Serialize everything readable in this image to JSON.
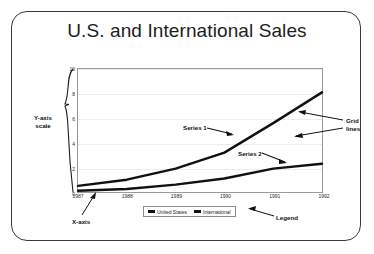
{
  "slide": {
    "title": "U.S. and International Sales",
    "background_color": "#ffffff",
    "border_color": "#3a3a3a"
  },
  "annotations": {
    "series1": "Series 1",
    "series2": "Series 2",
    "gridlines_line1": "Grid",
    "gridlines_line2": "lines",
    "yaxis_line1": "Y-axis",
    "yaxis_line2": "scale",
    "xaxis": "X-axis",
    "legend": "Legend"
  },
  "legend": {
    "items": [
      {
        "label": "United States",
        "color": "#111111"
      },
      {
        "label": "International",
        "color": "#111111"
      }
    ]
  },
  "chart_data": {
    "type": "line",
    "title": "U.S. and International Sales",
    "xlabel": "",
    "ylabel": "",
    "x": [
      "1987",
      "1988",
      "1989",
      "1990",
      "1991",
      "1992"
    ],
    "categories": [
      "1987",
      "1988",
      "1989",
      "1990",
      "1991",
      "1992"
    ],
    "yticks": [
      0,
      2,
      4,
      6,
      8,
      10
    ],
    "xticks": [
      "1987",
      "1988",
      "1989",
      "1990",
      "1991",
      "1992"
    ],
    "ylim": [
      0,
      10
    ],
    "grid": true,
    "grid_color": "#ececec",
    "legend_position": "bottom",
    "series": [
      {
        "name": "United States",
        "annotation": "Series 1",
        "color": "#111111",
        "values": [
          0.5,
          1.0,
          1.9,
          3.2,
          5.6,
          8.1
        ]
      },
      {
        "name": "International",
        "annotation": "Series 2",
        "color": "#111111",
        "values": [
          0.1,
          0.25,
          0.6,
          1.1,
          1.9,
          2.3
        ]
      }
    ]
  }
}
